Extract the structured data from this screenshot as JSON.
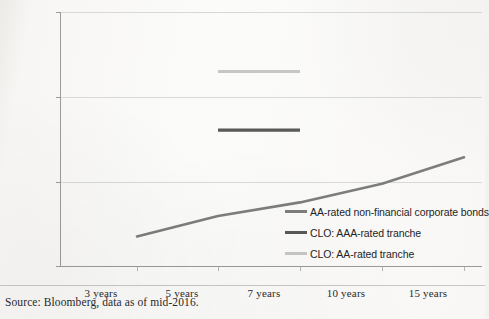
{
  "chart_data": {
    "type": "line",
    "title": "",
    "subtitle": "",
    "xlabel": "",
    "ylabel": "",
    "ylim": [
      0,
      300
    ],
    "yticks": [
      0,
      100,
      200,
      300
    ],
    "ytick_labels": [
      "0",
      "100",
      "200",
      "300"
    ],
    "categories": [
      "3 years",
      "5 years",
      "7 years",
      "10 years",
      "15 years"
    ],
    "grid": "horizontal",
    "legend_position": "inside-right",
    "series": [
      {
        "name": "AA-rated non-financial corporate bonds",
        "type": "line",
        "color": "#7d7d7d",
        "x": [
          "3 years",
          "5 years",
          "7 years",
          "10 years",
          "15 years"
        ],
        "values": [
          36,
          60,
          76,
          98,
          129
        ]
      },
      {
        "name": "CLO: AAA-rated tranche",
        "type": "segment",
        "color": "#595959",
        "x_start": "5 years",
        "x_end": "7 years",
        "value": 161
      },
      {
        "name": "CLO: AA-rated tranche",
        "type": "segment",
        "color": "#c6c6c6",
        "x_start": "5 years",
        "x_end": "7 years",
        "value": 230
      }
    ],
    "legend": [
      {
        "label": "AA-rated non-financial corporate bonds",
        "color": "#7d7d7d"
      },
      {
        "label": "CLO: AAA-rated tranche",
        "color": "#595959"
      },
      {
        "label": "CLO: AA-rated tranche",
        "color": "#c6c6c6"
      }
    ],
    "annotations": []
  },
  "axis": {
    "y_labels": [
      "300",
      "200",
      "100",
      "0"
    ],
    "x_labels": [
      "3 years",
      "5 years",
      "7 years",
      "10 years",
      "15 years"
    ]
  },
  "footer": {
    "source": "Source: Bloomberg, data as of mid-2016."
  }
}
